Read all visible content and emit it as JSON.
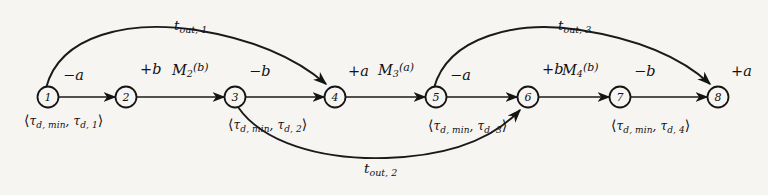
{
  "figure": {
    "kind": "timed-event-graph",
    "background_color": "#f6f5f2",
    "ink_color": "#141414"
  },
  "nodes": [
    {
      "id": "n1",
      "label": "1",
      "x": 48,
      "y": 97
    },
    {
      "id": "n2",
      "label": "2",
      "x": 126,
      "y": 97
    },
    {
      "id": "n3",
      "label": "3",
      "x": 235,
      "y": 97
    },
    {
      "id": "n4",
      "label": "4",
      "x": 335,
      "y": 97
    },
    {
      "id": "n5",
      "label": "5",
      "x": 436,
      "y": 97
    },
    {
      "id": "n6",
      "label": "6",
      "x": 528,
      "y": 97
    },
    {
      "id": "n7",
      "label": "7",
      "x": 620,
      "y": 97
    },
    {
      "id": "n8",
      "label": "8",
      "x": 718,
      "y": 97
    }
  ],
  "sign_labels": [
    {
      "name": "sign-node-1",
      "text": "−a",
      "x": 63,
      "y": 78
    },
    {
      "name": "sign-node-2",
      "text": "+b",
      "x": 140,
      "y": 72
    },
    {
      "name": "sign-node-3",
      "text": "−b",
      "x": 249,
      "y": 74
    },
    {
      "name": "sign-node-4",
      "text": "+a",
      "x": 348,
      "y": 74
    },
    {
      "name": "sign-node-5",
      "text": "−a",
      "x": 450,
      "y": 78
    },
    {
      "name": "sign-node-6",
      "text": "+b",
      "x": 542,
      "y": 72
    },
    {
      "name": "sign-node-7",
      "text": "−b",
      "x": 634,
      "y": 74
    },
    {
      "name": "sign-node-8",
      "text": "+a",
      "x": 731,
      "y": 74
    }
  ],
  "marking_labels": [
    {
      "name": "marking-m2",
      "base": "M",
      "sub": "2",
      "arg": "(b)",
      "x": 172,
      "y": 72
    },
    {
      "name": "marking-m3",
      "base": "M",
      "sub": "3",
      "arg": "(a)",
      "x": 378,
      "y": 72
    },
    {
      "name": "marking-m4",
      "base": "M",
      "sub": "4",
      "arg": "(b)",
      "x": 562,
      "y": 72
    }
  ],
  "delay_labels": [
    {
      "name": "delay-node-1",
      "open": "⟨",
      "tau": "τ",
      "min": "d, min",
      "sep": ", ",
      "tau2": "τ",
      "idx": "d, 1",
      "close": "⟩",
      "x": 48,
      "y": 119
    },
    {
      "name": "delay-node-3",
      "open": "⟨",
      "tau": "τ",
      "min": "d, min",
      "sep": ", ",
      "tau2": "τ",
      "idx": "d, 2",
      "close": "⟩",
      "x": 250,
      "y": 123
    },
    {
      "name": "delay-node-5",
      "open": "⟨",
      "tau": "τ",
      "min": "d, min",
      "sep": ", ",
      "tau2": "τ",
      "idx": "d, 3",
      "close": "⟩",
      "x": 450,
      "y": 124
    },
    {
      "name": "delay-node-7",
      "open": "⟨",
      "tau": "τ",
      "min": "d, min",
      "sep": ", ",
      "tau2": "τ",
      "idx": "d, 4",
      "close": "⟩",
      "x": 633,
      "y": 124
    }
  ],
  "arc_labels": [
    {
      "name": "timeout-1-label",
      "base": "t",
      "sub": "out, 1",
      "x": 196,
      "y": 26
    },
    {
      "name": "timeout-2-label",
      "base": "t",
      "sub": "out, 2",
      "x": 386,
      "y": 165
    },
    {
      "name": "timeout-3-label",
      "base": "t",
      "sub": "out, 3",
      "x": 580,
      "y": 26
    }
  ],
  "straight_edges": [
    {
      "name": "edge-1-2",
      "from": "n1",
      "to": "n2"
    },
    {
      "name": "edge-2-3",
      "from": "n2",
      "to": "n3"
    },
    {
      "name": "edge-3-4",
      "from": "n3",
      "to": "n4"
    },
    {
      "name": "edge-4-5",
      "from": "n4",
      "to": "n5"
    },
    {
      "name": "edge-5-6",
      "from": "n5",
      "to": "n6"
    },
    {
      "name": "edge-6-7",
      "from": "n6",
      "to": "n7"
    },
    {
      "name": "edge-7-8",
      "from": "n7",
      "to": "n8"
    }
  ],
  "curved_edges": [
    {
      "name": "timeout-arc-1",
      "from": "n1",
      "to": "n4",
      "direction": "above"
    },
    {
      "name": "timeout-arc-2",
      "from": "n3",
      "to": "n6",
      "direction": "below"
    },
    {
      "name": "timeout-arc-3",
      "from": "n5",
      "to": "n8",
      "direction": "above"
    }
  ]
}
